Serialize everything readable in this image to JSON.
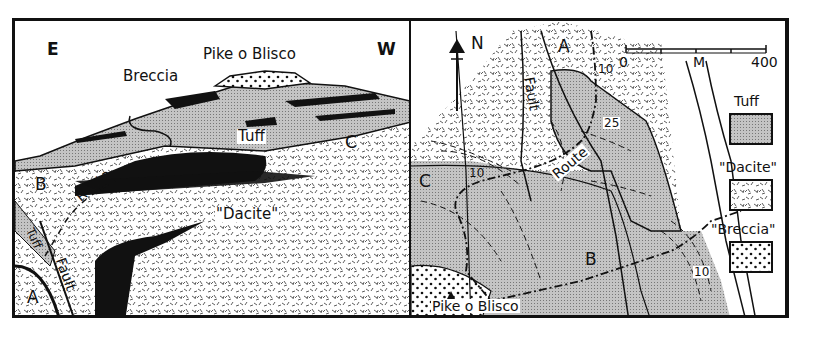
{
  "figure": {
    "cross_section": {
      "direction_left": "E",
      "direction_right": "W",
      "peak_label": "Pike o Blisco",
      "labels": {
        "breccia": "Breccia",
        "tuff": "Tuff",
        "dacite": "\"Dacite\"",
        "route": "Route",
        "fault": "Fault",
        "tuff_small": "Tuff",
        "point_a": "A",
        "point_b": "B",
        "point_c": "C"
      }
    },
    "map": {
      "north_label": "N",
      "scale_bar": {
        "start": "0",
        "unit": "M",
        "end": "400"
      },
      "labels": {
        "fault": "Fault",
        "route": "Route",
        "peak": "Pike o Blisco",
        "point_a": "A",
        "point_b": "B",
        "point_c": "C",
        "dip_1": "10",
        "dip_2": "25",
        "dip_3": "10",
        "dip_4": "10"
      },
      "legend": [
        {
          "label": "Tuff",
          "pattern": "fine-stipple-grey"
        },
        {
          "label": "\"Dacite\"",
          "pattern": "dashes"
        },
        {
          "label": "\"Breccia\"",
          "pattern": "dots"
        }
      ]
    },
    "colors": {
      "ink": "#111111",
      "tuff_fill": "#bdbdbd",
      "paper": "#ffffff"
    }
  }
}
